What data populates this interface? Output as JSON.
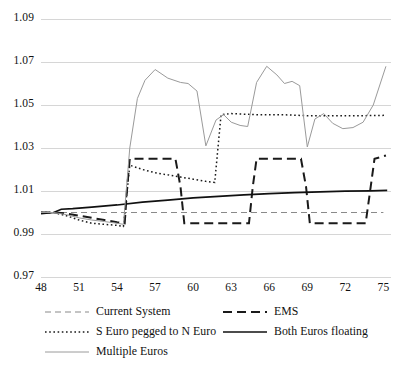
{
  "chart_data": {
    "type": "line",
    "title": "",
    "xlabel": "",
    "ylabel": "",
    "xlim": [
      48,
      75.6
    ],
    "ylim": [
      0.97,
      1.09
    ],
    "ytick_step": 0.02,
    "xtick_step": 3,
    "grid": true,
    "legend_position": "below",
    "yticks": [
      "1.09",
      "1.07",
      "1.05",
      "1.03",
      "1.01",
      "0.99",
      "0.97"
    ],
    "ytick_values": [
      1.09,
      1.07,
      1.05,
      1.03,
      1.01,
      0.99,
      0.97
    ],
    "xticks": [
      "48",
      "51",
      "54",
      "57",
      "60",
      "63",
      "66",
      "69",
      "72",
      "75"
    ],
    "xtick_values": [
      48,
      51,
      54,
      57,
      60,
      63,
      66,
      69,
      72,
      75
    ],
    "series": [
      {
        "name": "Current System",
        "style": "dashed",
        "color": "#8a8a8a",
        "width": 1.1,
        "dash": "6,4",
        "x": [
          48,
          49,
          50,
          51,
          52,
          53,
          54,
          55,
          56,
          57,
          58,
          59,
          60,
          61,
          62,
          63,
          64,
          65,
          66,
          67,
          68,
          69,
          70,
          71,
          72,
          73,
          74,
          75
        ],
        "y": [
          1.0,
          1.0,
          1.0,
          1.0,
          1.0,
          1.0,
          1.0,
          1.0,
          1.0,
          1.0,
          1.0,
          1.0,
          1.0,
          1.0,
          1.0,
          1.0,
          1.0,
          1.0,
          1.0,
          1.0,
          1.0,
          1.0,
          1.0,
          1.0,
          1.0,
          1.0,
          1.0,
          1.0
        ]
      },
      {
        "name": "EMS",
        "style": "dashed",
        "color": "#1a1a1a",
        "width": 2.0,
        "dash": "9,5",
        "x": [
          48,
          49,
          50,
          51,
          52,
          53,
          54,
          54.6,
          54.8,
          55,
          58.6,
          59.0,
          59.3,
          64.4,
          64.7,
          65.0,
          68.5,
          68.9,
          69.2,
          73.6,
          74.0,
          74.3,
          75.2
        ],
        "y": [
          1.0,
          1.0,
          0.9995,
          0.9985,
          0.9975,
          0.9965,
          0.9955,
          0.995,
          1.012,
          1.025,
          1.025,
          1.012,
          0.995,
          0.995,
          1.012,
          1.025,
          1.025,
          1.012,
          0.995,
          0.995,
          1.012,
          1.025,
          1.0265
        ]
      },
      {
        "name": "S Euro pegged to N Euro",
        "style": "dotted",
        "color": "#1a1a1a",
        "width": 1.5,
        "dash": "1.6,2.6",
        "x": [
          48,
          49,
          50,
          51,
          52,
          53,
          54,
          54.5,
          55,
          56,
          57,
          58,
          59,
          60,
          61,
          61.7,
          62.2,
          63,
          65,
          67,
          69,
          71,
          73,
          75.2
        ],
        "y": [
          1.0,
          1.0,
          0.9985,
          0.9965,
          0.995,
          0.9945,
          0.994,
          0.9935,
          1.022,
          1.02,
          1.0185,
          1.0175,
          1.0165,
          1.0155,
          1.0145,
          1.014,
          1.0455,
          1.046,
          1.0455,
          1.0455,
          1.045,
          1.045,
          1.045,
          1.0452
        ]
      },
      {
        "name": "Both Euros floating",
        "style": "solid",
        "color": "#111111",
        "width": 1.7,
        "dash": "",
        "x": [
          48,
          49,
          49.6,
          50.5,
          52,
          54,
          56,
          58,
          60,
          62,
          64,
          66,
          68,
          70,
          72,
          74,
          75.3
        ],
        "y": [
          0.9995,
          1.0,
          1.0015,
          1.0018,
          1.0025,
          1.0035,
          1.0048,
          1.0058,
          1.0068,
          1.0075,
          1.0082,
          1.0088,
          1.0092,
          1.0096,
          1.0099,
          1.0101,
          1.0103
        ]
      },
      {
        "name": "Multiple Euros",
        "style": "solid",
        "color": "#9a9a9a",
        "width": 1.0,
        "dash": "",
        "x": [
          48,
          49,
          50,
          51,
          52,
          53,
          54,
          54.5,
          55.0,
          55.6,
          56.2,
          57.0,
          58.0,
          59.0,
          59.6,
          60.3,
          61.0,
          61.8,
          62.4,
          63.0,
          63.7,
          64.3,
          65.0,
          65.8,
          66.6,
          67.2,
          67.8,
          68.4,
          69.0,
          69.6,
          70.3,
          71.0,
          71.8,
          72.6,
          73.4,
          74.2,
          75.2
        ],
        "y": [
          1.0,
          1.0,
          0.999,
          0.9975,
          0.9965,
          0.9958,
          0.995,
          0.9945,
          1.03,
          1.053,
          1.0615,
          1.0665,
          1.0625,
          1.0605,
          1.06,
          1.0565,
          1.031,
          1.043,
          1.0455,
          1.042,
          1.0405,
          1.04,
          1.0605,
          1.068,
          1.064,
          1.06,
          1.061,
          1.059,
          1.0305,
          1.0435,
          1.046,
          1.0415,
          1.039,
          1.0395,
          1.042,
          1.05,
          1.068
        ]
      }
    ]
  },
  "legend": {
    "items": [
      {
        "label": "Current System",
        "style": "dashed",
        "color": "#8a8a8a",
        "width": 1.1,
        "dash": "6,4",
        "col": 0,
        "row": 0
      },
      {
        "label": "EMS",
        "style": "dashed",
        "color": "#1a1a1a",
        "width": 2.0,
        "dash": "9,5",
        "col": 1,
        "row": 0
      },
      {
        "label": "S Euro pegged to N Euro",
        "style": "dotted",
        "color": "#1a1a1a",
        "width": 1.5,
        "dash": "1.6,2.6",
        "col": 0,
        "row": 1
      },
      {
        "label": "Both Euros floating",
        "style": "solid",
        "color": "#111111",
        "width": 1.7,
        "dash": "",
        "col": 1,
        "row": 1
      },
      {
        "label": "Multiple Euros",
        "style": "solid",
        "color": "#9a9a9a",
        "width": 1.0,
        "dash": "",
        "col": 0,
        "row": 2
      }
    ]
  },
  "colors": {
    "grid": "#d6d6d6",
    "axis_text": "#111111",
    "background": "#ffffff"
  }
}
